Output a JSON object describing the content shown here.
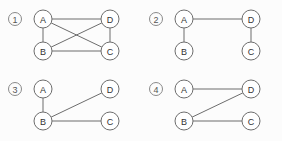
{
  "figure": {
    "title": "",
    "background_color": "#fcfcfc",
    "stroke_color": "#6d6d6d",
    "node_fill_color": "#ffffff",
    "label_color": "#333333",
    "node_radius": 9,
    "panels": [
      {
        "index_label": "1",
        "index_symbol": "①",
        "nodes": [
          {
            "id": "A",
            "label": "A",
            "x": 43,
            "y": 19
          },
          {
            "id": "D",
            "label": "D",
            "x": 110,
            "y": 19
          },
          {
            "id": "B",
            "label": "B",
            "x": 43,
            "y": 51
          },
          {
            "id": "C",
            "label": "C",
            "x": 110,
            "y": 51
          }
        ],
        "edges": [
          {
            "from": "A",
            "to": "D"
          },
          {
            "from": "A",
            "to": "B"
          },
          {
            "from": "A",
            "to": "C"
          },
          {
            "from": "B",
            "to": "D"
          },
          {
            "from": "B",
            "to": "C"
          },
          {
            "from": "D",
            "to": "C"
          }
        ],
        "edge_count": 6,
        "description": "complete graph on four vertices"
      },
      {
        "index_label": "2",
        "index_symbol": "②",
        "nodes": [
          {
            "id": "A",
            "label": "A",
            "x": 43,
            "y": 19
          },
          {
            "id": "D",
            "label": "D",
            "x": 110,
            "y": 19
          },
          {
            "id": "B",
            "label": "B",
            "x": 43,
            "y": 51
          },
          {
            "id": "C",
            "label": "C",
            "x": 110,
            "y": 51
          }
        ],
        "edges": [
          {
            "from": "A",
            "to": "D"
          },
          {
            "from": "A",
            "to": "B"
          },
          {
            "from": "D",
            "to": "C"
          }
        ],
        "edge_count": 3,
        "description": "path B-A-D-C"
      },
      {
        "index_label": "3",
        "index_symbol": "③",
        "nodes": [
          {
            "id": "A",
            "label": "A",
            "x": 43,
            "y": 19
          },
          {
            "id": "D",
            "label": "D",
            "x": 110,
            "y": 19
          },
          {
            "id": "B",
            "label": "B",
            "x": 43,
            "y": 51
          },
          {
            "id": "C",
            "label": "C",
            "x": 110,
            "y": 51
          }
        ],
        "edges": [
          {
            "from": "A",
            "to": "B"
          },
          {
            "from": "B",
            "to": "D"
          },
          {
            "from": "B",
            "to": "C"
          }
        ],
        "edge_count": 3,
        "description": "star centred at B"
      },
      {
        "index_label": "4",
        "index_symbol": "④",
        "nodes": [
          {
            "id": "A",
            "label": "A",
            "x": 43,
            "y": 19
          },
          {
            "id": "D",
            "label": "D",
            "x": 110,
            "y": 19
          },
          {
            "id": "B",
            "label": "B",
            "x": 43,
            "y": 51
          },
          {
            "id": "C",
            "label": "C",
            "x": 110,
            "y": 51
          }
        ],
        "edges": [
          {
            "from": "A",
            "to": "D"
          },
          {
            "from": "B",
            "to": "D"
          },
          {
            "from": "B",
            "to": "C"
          }
        ],
        "edge_count": 3,
        "description": "path A-D-B-C"
      }
    ],
    "panel_positions": [
      {
        "left": 0,
        "top": 0
      },
      {
        "left": 141,
        "top": 0
      },
      {
        "left": 0,
        "top": 70
      },
      {
        "left": 141,
        "top": 70
      }
    ],
    "index_marker": {
      "x": 15,
      "y": 19,
      "radius": 6.5
    }
  }
}
